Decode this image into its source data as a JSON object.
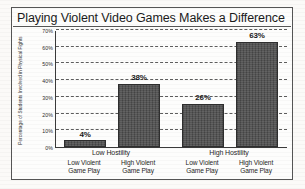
{
  "chart_data": {
    "type": "bar",
    "title": "Playing Violent Video Games Makes a Difference",
    "xlabel": "",
    "ylabel": "Percentage of Students Involved in Physical Fights",
    "ylim": [
      0,
      70
    ],
    "grid": true,
    "legend": "none",
    "categories": [
      "Low Violent Game Play",
      "High Violent Game Play",
      "Low Violent Game Play",
      "High Violent Game Play"
    ],
    "values": [
      4,
      38,
      26,
      63
    ],
    "value_labels": [
      "4%",
      "38%",
      "26%",
      "63%"
    ],
    "groups": [
      {
        "label": "Low Hostility",
        "bar_indices": [
          0,
          1
        ]
      },
      {
        "label": "High Hostility",
        "bar_indices": [
          2,
          3
        ]
      }
    ],
    "ytick_labels": [
      "0%",
      "10%",
      "20%",
      "30%",
      "40%",
      "50%",
      "60%",
      "70%"
    ],
    "ytick_values": [
      0,
      10,
      20,
      30,
      40,
      50,
      60,
      70
    ],
    "bar_color": "#4d4d4d",
    "bar_edge_color": "#2e2e2e",
    "axis_color": "#3a3a3a",
    "gridline_color": "#5d5d5d",
    "background_color": "#fdfdfc"
  },
  "category_label_lines": [
    {
      "line1": "Low Violent",
      "line2": "Game Play"
    },
    {
      "line1": "High Violent",
      "line2": "Game Play"
    },
    {
      "line1": "Low Violent",
      "line2": "Game Play"
    },
    {
      "line1": "High Violent",
      "line2": "Game Play"
    }
  ]
}
